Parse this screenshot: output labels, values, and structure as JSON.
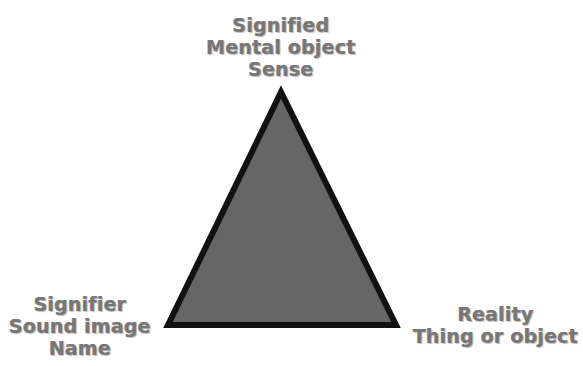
{
  "diagram": {
    "type": "semiotic-triangle",
    "colors": {
      "fill": "#666666",
      "outline": "#111111",
      "text": "#777777"
    },
    "vertices": {
      "top": {
        "lines": [
          "Signified",
          "Mental object",
          "Sense"
        ]
      },
      "left": {
        "lines": [
          "Signifier",
          "Sound image",
          "Name"
        ]
      },
      "right": {
        "lines": [
          "Reality",
          "Thing or object"
        ]
      }
    }
  }
}
